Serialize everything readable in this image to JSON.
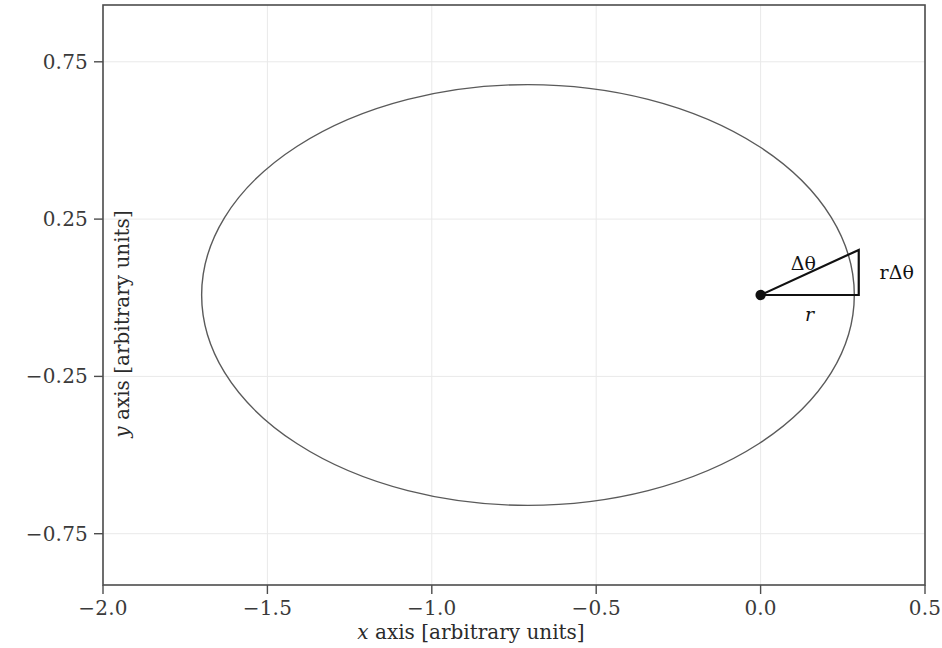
{
  "chart_data": {
    "type": "line",
    "title": "",
    "xlabel": "x axis [arbitrary units]",
    "ylabel": "y axis [arbitrary units]",
    "xlim": [
      -2.0,
      0.5
    ],
    "ylim": [
      -1.0,
      1.0
    ],
    "xticks": [
      -2.0,
      -1.5,
      -1.0,
      -0.5,
      0.0,
      0.5
    ],
    "xticklabels": [
      "−2.0",
      "−1.5",
      "−1.0",
      "−0.5",
      "0.0",
      "0.5"
    ],
    "yticks": [
      0.75,
      0.25,
      -0.25,
      -0.75
    ],
    "yticklabels": [
      "0.75",
      "0.25",
      "−0.25",
      "−0.75"
    ],
    "grid": true,
    "grid_color": "#e8e8e8",
    "legend": null,
    "line_color": "#5a5a5a",
    "line_width": 1.4,
    "series": [
      {
        "name": "orbit ellipse",
        "shape": "ellipse",
        "center_x": -0.7075,
        "center_y": 0.0,
        "semi_major_x": 0.9925,
        "semi_minor_y": 0.7255,
        "x_min": -1.7,
        "x_max": 0.285,
        "y_min": -0.7255,
        "y_max": 0.7255
      }
    ],
    "markers": [
      {
        "name": "focus-point",
        "x": 0.0,
        "y": 0.0,
        "color": "#111111",
        "size": 9
      }
    ],
    "annotations": [
      {
        "name": "delta-theta-label",
        "text": "Δθ",
        "x": 0.13,
        "y": 0.112
      },
      {
        "name": "r-label",
        "text": "r",
        "x": 0.149,
        "y": -0.066
      },
      {
        "name": "r-delta-theta-label",
        "text": "rΔθ",
        "x": 0.414,
        "y": 0.08
      }
    ],
    "annotation_shapes": [
      {
        "name": "wedge-triangle",
        "type": "polyline",
        "color": "#111111",
        "width": 2.2,
        "points": [
          [
            0.0,
            0.0
          ],
          [
            0.2985,
            0.0
          ],
          [
            0.2985,
            0.1555
          ],
          [
            0.0,
            0.0
          ]
        ]
      }
    ]
  },
  "axes": {
    "frame_color": "#4d4d4d",
    "background": "#ffffff"
  }
}
